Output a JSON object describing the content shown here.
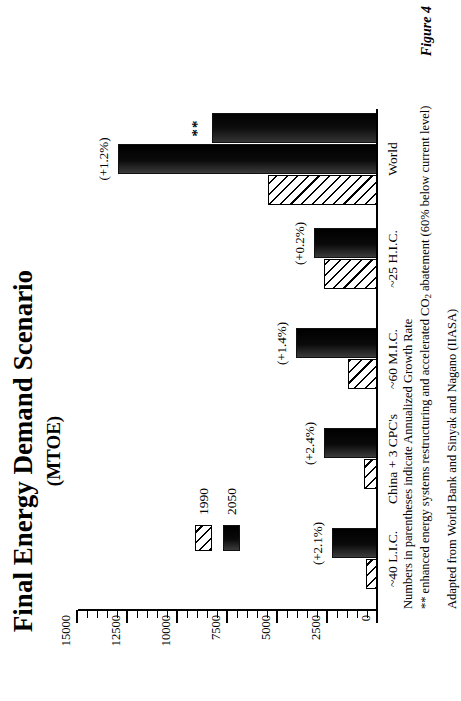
{
  "figure": {
    "title": "Final Energy Demand Scenario",
    "subtitle": "(MTOE)",
    "figure_label": "Figure 4"
  },
  "legend": {
    "items": [
      {
        "key": "1990",
        "label": "1990",
        "pattern": "diagonal-hatch"
      },
      {
        "key": "2050",
        "label": "2050",
        "pattern": "dark-gradient"
      }
    ]
  },
  "notes": {
    "line1": "Numbers in parentheses indicate Annualized Growth Rate",
    "line2_pre": "** enhanced energy systems restructuring and accelerated CO",
    "line2_sub": "2",
    "line2_post": " abatement (60% below current level)",
    "line3": "Adapted from World Bank and Sinyak and Nagano (IIASA)"
  },
  "chart_data": {
    "type": "bar",
    "title": "Final Energy Demand Scenario",
    "subtitle": "(MTOE)",
    "xlabel": "",
    "ylabel": "MTOE",
    "ylim": [
      0,
      15000
    ],
    "yticks": [
      0,
      2500,
      5000,
      7500,
      10000,
      12500,
      15000
    ],
    "ytick_labels": [
      "0",
      "2500",
      "5000",
      "7500",
      "10000",
      "12500",
      "15000"
    ],
    "minor_tick_interval": 500,
    "grid": false,
    "legend_position": "upper-left",
    "orientation": "vertical-bars-rendered-rotated",
    "categories": [
      "~40 L.I.C.",
      "China + 3 CPC's",
      "~60 M.I.C.",
      "~25 H.I.C.",
      "World"
    ],
    "series": [
      {
        "name": "1990",
        "values": [
          600,
          700,
          1500,
          2700,
          5500
        ]
      },
      {
        "name": "2050",
        "values": [
          2300,
          2700,
          4100,
          3200,
          13000
        ]
      },
      {
        "name": "2050 **",
        "values": [
          null,
          null,
          null,
          null,
          8300
        ]
      }
    ],
    "annotations": [
      {
        "category": "~40 L.I.C.",
        "series": "2050",
        "text": "(+2.1%)"
      },
      {
        "category": "China + 3 CPC's",
        "series": "2050",
        "text": "(+2.4%)"
      },
      {
        "category": "~60 M.I.C.",
        "series": "2050",
        "text": "(+1.4%)"
      },
      {
        "category": "~25 H.I.C.",
        "series": "2050",
        "text": "(+0.2%)"
      },
      {
        "category": "World",
        "series": "2050",
        "text": "(+1.2%)"
      },
      {
        "category": "World",
        "series": "2050 **",
        "text": "**"
      }
    ]
  },
  "groups": [
    {
      "category": "~40 L.I.C.",
      "bars": [
        {
          "series": "1990",
          "value": 600
        },
        {
          "series": "2050",
          "value": 2300,
          "label": "(+2.1%)"
        }
      ]
    },
    {
      "category": "China + 3 CPC's",
      "bars": [
        {
          "series": "1990",
          "value": 700
        },
        {
          "series": "2050",
          "value": 2700,
          "label": "(+2.4%)"
        }
      ]
    },
    {
      "category": "~60 M.I.C.",
      "bars": [
        {
          "series": "1990",
          "value": 1500
        },
        {
          "series": "2050",
          "value": 4100,
          "label": "(+1.4%)"
        }
      ]
    },
    {
      "category": "~25 H.I.C.",
      "bars": [
        {
          "series": "1990",
          "value": 2700
        },
        {
          "series": "2050",
          "value": 3200,
          "label": "(+0.2%)"
        }
      ]
    },
    {
      "category": "World",
      "bars": [
        {
          "series": "1990",
          "value": 5500
        },
        {
          "series": "2050",
          "value": 13000,
          "label": "(+1.2%)"
        },
        {
          "series": "2050 **",
          "value": 8300,
          "label": "**"
        }
      ]
    }
  ]
}
